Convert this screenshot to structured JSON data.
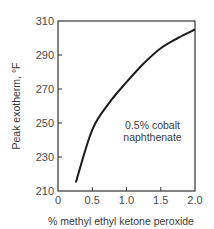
{
  "chart_data": {
    "type": "line",
    "title": "",
    "xlabel": "% methyl ethyl ketone peroxide",
    "ylabel": "Peak exotherm, °F",
    "xlim": [
      0,
      2.0
    ],
    "ylim": [
      210,
      310
    ],
    "x_ticks": [
      "0",
      "0.5",
      "1.0",
      "1.5",
      "2.0"
    ],
    "y_ticks": [
      "210",
      "230",
      "250",
      "270",
      "290",
      "310"
    ],
    "grid": false,
    "legend": null,
    "annotations": [
      {
        "text_line1": "0.5% cobalt",
        "text_line2": "naphthenate",
        "x": 1.38,
        "y": 246
      }
    ],
    "series": [
      {
        "name": "0.5% cobalt naphthenate",
        "x": [
          0.26,
          0.5,
          0.75,
          1.0,
          1.25,
          1.5,
          1.75,
          2.0
        ],
        "values": [
          215,
          246,
          262,
          274,
          285,
          294,
          300,
          305
        ]
      }
    ]
  },
  "colors": {
    "line": "#1a1a1a",
    "frame": "#333333",
    "text": "#4a4a4a"
  }
}
